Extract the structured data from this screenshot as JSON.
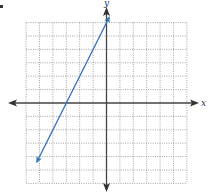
{
  "chart_data": {
    "type": "line",
    "title": "",
    "xlabel": "x",
    "ylabel": "y",
    "xlim": [
      -6,
      6
    ],
    "ylim": [
      -6,
      6
    ],
    "grid": true,
    "grid_style": "dotted",
    "grid_step": 1,
    "legend": null,
    "series": [
      {
        "name": "line",
        "equation": "y = 2x + 6",
        "slope": 2,
        "intercept": 6,
        "x_intercept": -3,
        "x": [
          -5.25,
          0.25
        ],
        "y": [
          -4.5,
          6.5
        ],
        "arrows": "both",
        "color": "#3a78b5"
      }
    ]
  },
  "labels": {
    "x_axis": "x",
    "y_axis": "y"
  },
  "colors": {
    "line": "#3a78b5",
    "axis": "#444444",
    "grid": "#9a9a9a"
  }
}
